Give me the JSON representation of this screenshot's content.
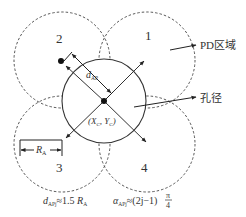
{
  "diagram": {
    "central_circle": {
      "label": "孔径",
      "center_label": "(X_C, Y_C)",
      "center_x": "X",
      "center_sub_x": "C",
      "center_y": "Y",
      "center_sub_y": "C"
    },
    "regions": [
      {
        "id": "1",
        "label": "1"
      },
      {
        "id": "2",
        "label": "2"
      },
      {
        "id": "3",
        "label": "3"
      },
      {
        "id": "4",
        "label": "4"
      }
    ],
    "annotations": {
      "pd_region": "PD区域",
      "aperture": "孔径",
      "distance_label": "d",
      "distance_sub": "AP",
      "radius_label": "R",
      "radius_sub": "A"
    },
    "formulas": {
      "distance": {
        "var": "d",
        "sub": "APj",
        "rest": "≈1.5 ",
        "r": "R",
        "r_sub": "A"
      },
      "angle": {
        "var": "α",
        "sub": "APj",
        "rest": "≈(2j−1)",
        "num": "π",
        "den": "4"
      }
    }
  }
}
